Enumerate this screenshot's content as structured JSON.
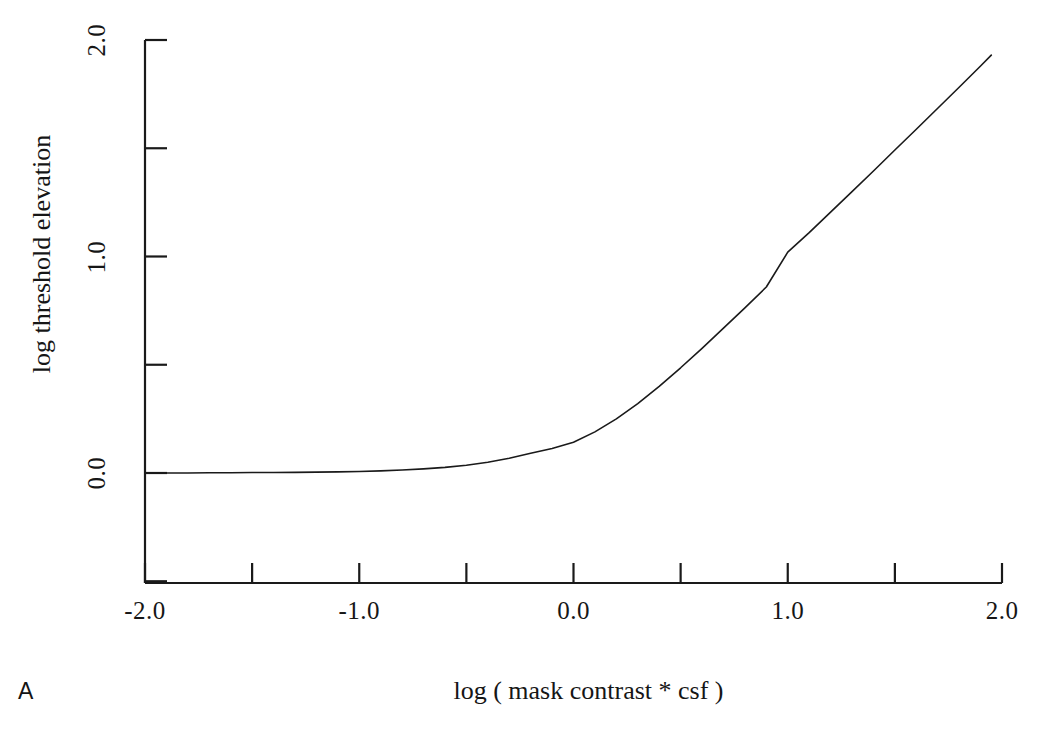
{
  "figure": {
    "panel_label": "A",
    "background_color": "#ffffff",
    "ink_color": "#1a1a1a"
  },
  "chart_data": {
    "type": "line",
    "title": "",
    "subtitle": "",
    "xlabel": "log ( mask contrast * csf )",
    "ylabel": "log threshold elevation",
    "xlim": [
      -2.0,
      2.0
    ],
    "ylim": [
      -0.5,
      2.0
    ],
    "grid": false,
    "legend": null,
    "legend_position": "none",
    "x_ticks": [
      -2.0,
      -1.5,
      -1.0,
      -0.5,
      0.0,
      0.5,
      1.0,
      1.5,
      2.0
    ],
    "x_tick_labels": [
      "-2.0",
      "",
      "-1.0",
      "",
      "0.0",
      "",
      "1.0",
      "",
      "2.0"
    ],
    "x_major_tick_labels": [
      {
        "value": -2.0,
        "text": "-2.0"
      },
      {
        "value": -1.0,
        "text": "-1.0"
      },
      {
        "value": 0.0,
        "text": "0.0"
      },
      {
        "value": 1.0,
        "text": "1.0"
      },
      {
        "value": 2.0,
        "text": "2.0"
      }
    ],
    "y_ticks": [
      -0.5,
      0.0,
      0.5,
      1.0,
      1.5,
      2.0
    ],
    "y_tick_labels": [
      "",
      "0.0",
      "",
      "1.0",
      "",
      "2.0"
    ],
    "y_major_tick_labels": [
      {
        "value": 0.0,
        "text": "0.0"
      },
      {
        "value": 1.0,
        "text": "1.0"
      },
      {
        "value": 2.0,
        "text": "2.0"
      }
    ],
    "series": [
      {
        "name": "threshold elevation",
        "color": "#1a1a1a",
        "line_width": 1.6,
        "x": [
          -2.0,
          -1.9,
          -1.8,
          -1.7,
          -1.6,
          -1.5,
          -1.4,
          -1.3,
          -1.2,
          -1.1,
          -1.0,
          -0.9,
          -0.8,
          -0.7,
          -0.6,
          -0.5,
          -0.4,
          -0.3,
          -0.2,
          -0.1,
          0.0,
          0.1,
          0.2,
          0.3,
          0.4,
          0.5,
          0.6,
          0.7,
          0.8,
          0.9,
          1.0,
          1.1,
          1.2,
          1.3,
          1.4,
          1.5,
          1.6,
          1.7,
          1.8,
          1.9,
          1.95
        ],
        "y": [
          0.0,
          0.0,
          0.0,
          0.001,
          0.001,
          0.002,
          0.002,
          0.003,
          0.004,
          0.005,
          0.007,
          0.01,
          0.014,
          0.019,
          0.026,
          0.036,
          0.05,
          0.068,
          0.091,
          0.113,
          0.142,
          0.19,
          0.25,
          0.32,
          0.4,
          0.486,
          0.576,
          0.669,
          0.763,
          0.859,
          1.02,
          1.11,
          1.205,
          1.3,
          1.395,
          1.492,
          1.588,
          1.685,
          1.782,
          1.88,
          1.93
        ]
      }
    ]
  },
  "axes": {
    "x_axis_name": "x-axis",
    "y_axis_name": "y-axis"
  }
}
